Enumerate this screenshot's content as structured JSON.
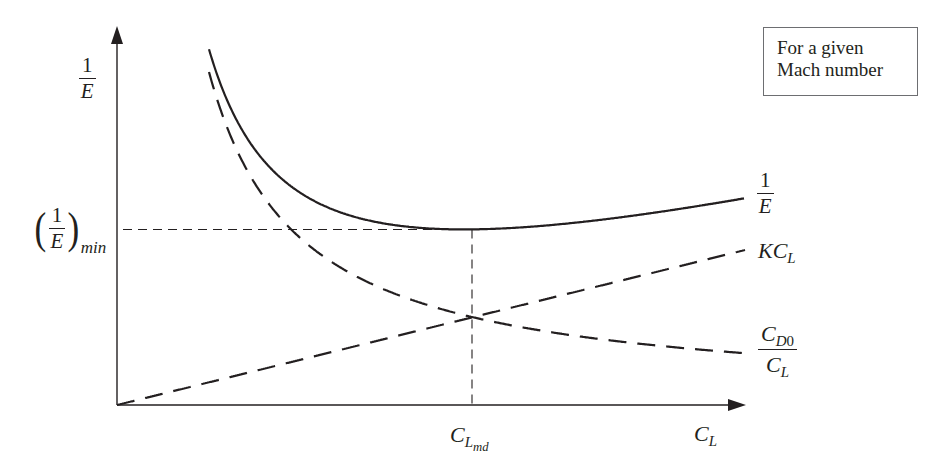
{
  "legend": {
    "line1": "For a given",
    "line2": "Mach number"
  },
  "axes": {
    "y_label_num": "1",
    "y_label_den": "E",
    "x_label_main": "C",
    "x_label_sub": "L",
    "x_tick_main": "C",
    "x_tick_sub": "L",
    "x_tick_subsub": "md",
    "y_tick_num": "1",
    "y_tick_den": "E",
    "y_tick_sub": "min",
    "y_tick_open": "(",
    "y_tick_close": ")"
  },
  "curve_labels": {
    "total_num": "1",
    "total_den": "E",
    "induced_main": "KC",
    "induced_sub": "L",
    "parasite_num_main": "C",
    "parasite_num_sub": "D",
    "parasite_num_subsub": "0",
    "parasite_den_main": "C",
    "parasite_den_sub": "L"
  },
  "colors": {
    "ink": "#231f20",
    "box_border": "#6d6e71"
  },
  "chart_data": {
    "type": "line",
    "title": "",
    "annotation": "For a given Mach number",
    "xlabel": "C_L",
    "ylabel": "1/E",
    "x_ticks": [
      "C_L_md"
    ],
    "y_ticks": [
      "(1/E)_min"
    ],
    "grid": false,
    "axis_pixels": {
      "origin": [
        117,
        405
      ],
      "x_end": 746,
      "y_end": 26
    },
    "series": [
      {
        "name": "1/E",
        "style": "solid",
        "formula": "C_D0/C_L + K*C_L",
        "x_range": [
          209,
          744
        ]
      },
      {
        "name": "KC_L",
        "style": "dashed",
        "formula": "K*C_L (linear)",
        "x_range": [
          117,
          745
        ],
        "slope_px": 0.2468
      },
      {
        "name": "C_D0/C_L",
        "style": "dashed",
        "formula": "hyperbola",
        "x_range": [
          209,
          745
        ],
        "x0_px": 120,
        "k_px": 29184,
        "c_px": 5.1
      }
    ],
    "reference_lines": [
      {
        "name": "(1/E)_min",
        "type": "horizontal",
        "style": "dashed",
        "y_px": 229
      },
      {
        "name": "C_L_md",
        "type": "vertical",
        "style": "dashed",
        "x_px": 472
      }
    ]
  }
}
